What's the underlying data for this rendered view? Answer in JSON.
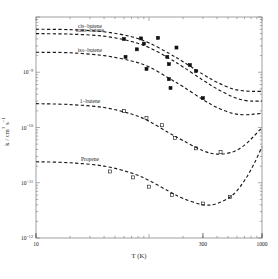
{
  "chart_data": {
    "type": "line",
    "title": "",
    "xlabel": "T (K)",
    "ylabel": "k / cm3 s-1",
    "xscale": "log",
    "yscale": "log",
    "xlim": [
      10,
      1000
    ],
    "ylim": [
      1e-12,
      1e-08
    ],
    "xticks": [
      10,
      300,
      1000
    ],
    "xtick_labels": [
      "10",
      "300",
      "1000"
    ],
    "yticks": [
      1e-12,
      1e-11,
      1e-10,
      1e-09
    ],
    "ytick_labels": [
      "10-12",
      "10-11",
      "10-10",
      "10-9"
    ],
    "grid": false,
    "legend_position": "inline-labels",
    "series": [
      {
        "name": "cis-butene",
        "label": "cis−butene",
        "marker": "filled-square",
        "linestyle": "dashed",
        "label_xy": [
          30,
          6e-09
        ],
        "x": [
          10,
          20,
          40,
          70,
          100,
          150,
          200,
          300,
          400,
          550,
          700,
          850,
          1000
        ],
        "y": [
          6e-09,
          5.9e-09,
          5.4e-09,
          4.4e-09,
          3.4e-09,
          2.2e-09,
          1.55e-09,
          9.2e-10,
          6.6e-10,
          5e-10,
          4.6e-10,
          4.5e-10,
          4.5e-10
        ]
      },
      {
        "name": "trans-butene",
        "label": "trans−butene",
        "marker": "filled-square",
        "linestyle": "dashed",
        "label_xy": [
          30,
          5e-09
        ],
        "x": [
          10,
          20,
          40,
          70,
          100,
          150,
          200,
          300,
          400,
          550,
          700,
          850,
          1000
        ],
        "y": [
          5e-09,
          4.9e-09,
          4.5e-09,
          3.6e-09,
          2.8e-09,
          1.8e-09,
          1.25e-09,
          7.2e-10,
          5e-10,
          3.6e-10,
          3.1e-10,
          3e-10,
          3e-10
        ]
      },
      {
        "name": "iso-butene",
        "label": "iso−butene",
        "marker": "filled-square",
        "linestyle": "dashed",
        "label_xy": [
          30,
          2.2e-09
        ],
        "x": [
          10,
          20,
          40,
          70,
          100,
          150,
          200,
          300,
          400,
          550,
          700,
          850,
          1000
        ],
        "y": [
          2.3e-09,
          2.25e-09,
          2e-09,
          1.6e-09,
          1.25e-09,
          7.8e-10,
          5.5e-10,
          3.2e-10,
          2.3e-10,
          1.8e-10,
          1.7e-10,
          1.75e-10,
          1.8e-10
        ]
      },
      {
        "name": "1-butene",
        "label": "1−butene",
        "marker": "open-square",
        "linestyle": "dashed",
        "label_xy": [
          30,
          2.6e-10
        ],
        "x": [
          10,
          20,
          40,
          70,
          100,
          150,
          200,
          300,
          400,
          550,
          700,
          850,
          1000
        ],
        "y": [
          2.7e-10,
          2.6e-10,
          2.3e-10,
          1.75e-10,
          1.3e-10,
          8e-11,
          5.8e-11,
          3.8e-11,
          3.3e-11,
          3.6e-11,
          4.8e-11,
          7e-11,
          1e-10
        ]
      },
      {
        "name": "Propene",
        "label": "Propene",
        "marker": "open-square",
        "linestyle": "dashed",
        "label_xy": [
          30,
          2.3e-11
        ],
        "x": [
          10,
          20,
          40,
          70,
          100,
          150,
          200,
          300,
          400,
          550,
          700,
          850,
          1000
        ],
        "y": [
          2.4e-11,
          2.3e-11,
          2e-11,
          1.5e-11,
          1.1e-11,
          7e-12,
          5.2e-12,
          4e-12,
          4.2e-12,
          6e-12,
          1.1e-11,
          2.2e-11,
          4.5e-11
        ]
      }
    ],
    "points": [
      {
        "series": "cis-butene",
        "marker": "filled-square",
        "x": 85,
        "y": 4.1e-09
      },
      {
        "series": "cis-butene",
        "marker": "filled-square",
        "x": 90,
        "y": 3.3e-09
      },
      {
        "series": "cis-butene",
        "marker": "filled-square",
        "x": 120,
        "y": 4.2e-09
      },
      {
        "series": "cis-butene",
        "marker": "filled-square",
        "x": 175,
        "y": 2.8e-09
      },
      {
        "series": "cis-butene",
        "marker": "filled-square",
        "x": 230,
        "y": 1.35e-09
      },
      {
        "series": "trans-butene",
        "marker": "filled-square",
        "x": 60,
        "y": 4e-09
      },
      {
        "series": "trans-butene",
        "marker": "filled-square",
        "x": 78,
        "y": 2.6e-09
      },
      {
        "series": "trans-butene",
        "marker": "filled-square",
        "x": 145,
        "y": 1.9e-09
      },
      {
        "series": "trans-butene",
        "marker": "filled-square",
        "x": 150,
        "y": 1.4e-09
      },
      {
        "series": "trans-butene",
        "marker": "filled-square",
        "x": 260,
        "y": 1.05e-09
      },
      {
        "series": "iso-butene",
        "marker": "filled-square",
        "x": 62,
        "y": 1.9e-09
      },
      {
        "series": "iso-butene",
        "marker": "filled-square",
        "x": 95,
        "y": 1.15e-09
      },
      {
        "series": "iso-butene",
        "marker": "filled-square",
        "x": 150,
        "y": 7.5e-10
      },
      {
        "series": "iso-butene",
        "marker": "filled-square",
        "x": 155,
        "y": 5.2e-10
      },
      {
        "series": "iso-butene",
        "marker": "filled-square",
        "x": 300,
        "y": 3.4e-10
      },
      {
        "series": "1-butene",
        "marker": "open-square",
        "x": 60,
        "y": 2e-10
      },
      {
        "series": "1-butene",
        "marker": "open-square",
        "x": 95,
        "y": 1.5e-10
      },
      {
        "series": "1-butene",
        "marker": "open-square",
        "x": 130,
        "y": 1.1e-10
      },
      {
        "series": "1-butene",
        "marker": "open-square",
        "x": 170,
        "y": 6.5e-11
      },
      {
        "series": "1-butene",
        "marker": "open-square",
        "x": 260,
        "y": 4.2e-11
      },
      {
        "series": "1-butene",
        "marker": "open-square",
        "x": 430,
        "y": 3.6e-11
      },
      {
        "series": "Propene",
        "marker": "open-square",
        "x": 45,
        "y": 1.6e-11
      },
      {
        "series": "Propene",
        "marker": "open-square",
        "x": 72,
        "y": 1.25e-11
      },
      {
        "series": "Propene",
        "marker": "open-square",
        "x": 100,
        "y": 8.5e-12
      },
      {
        "series": "Propene",
        "marker": "open-square",
        "x": 160,
        "y": 6e-12
      },
      {
        "series": "Propene",
        "marker": "open-square",
        "x": 300,
        "y": 4.2e-12
      },
      {
        "series": "Propene",
        "marker": "open-square",
        "x": 520,
        "y": 5.5e-12
      }
    ]
  },
  "axes": {
    "x_label": "T (K)",
    "y_label_main": "k / cm",
    "y_label_sup1": "3",
    "y_label_mid": " s",
    "y_label_sup2": "−1",
    "x_tick_labels": [
      "10",
      "300",
      "1000"
    ],
    "y_tick_labels": [
      "10",
      "10",
      "10",
      "10"
    ],
    "y_tick_exponents": [
      "−12",
      "−11",
      "−10",
      "−9"
    ]
  }
}
